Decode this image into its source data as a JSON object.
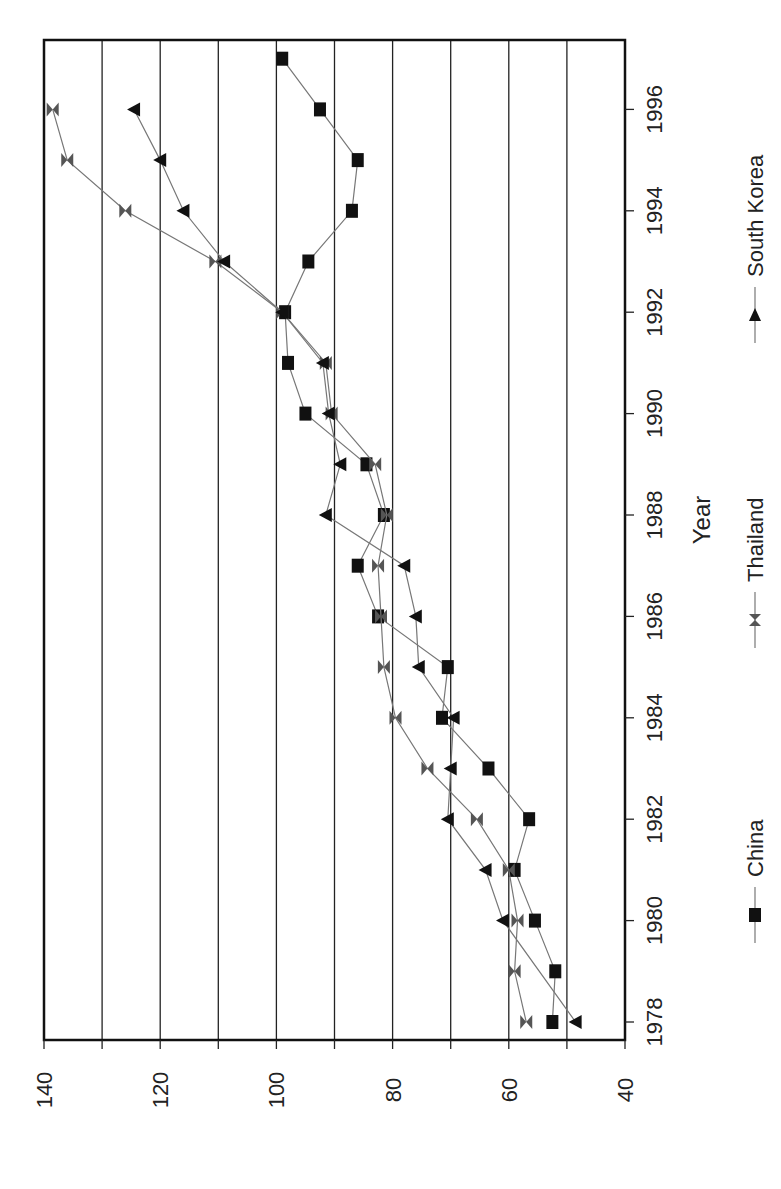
{
  "chart_data": {
    "type": "line",
    "orientation_note": "figure rendered rotated 90 degrees (text reads bottom-to-top)",
    "title": "",
    "xlabel": "Year",
    "ylabel": "",
    "x": [
      1978,
      1979,
      1980,
      1981,
      1982,
      1983,
      1984,
      1985,
      1986,
      1987,
      1988,
      1989,
      1990,
      1991,
      1992,
      1993,
      1994,
      1995,
      1996,
      1997
    ],
    "x_ticks": [
      1978,
      1980,
      1982,
      1984,
      1986,
      1988,
      1990,
      1992,
      1994,
      1996
    ],
    "y_ticks": [
      40,
      60,
      80,
      100,
      120,
      140
    ],
    "ylim": [
      40,
      140
    ],
    "grid": {
      "y_major_every": 10,
      "on": true
    },
    "legend_position": "bottom",
    "series": [
      {
        "name": "China",
        "marker": "square",
        "color": "#111111",
        "values": [
          52.5,
          52,
          55.5,
          59,
          56.5,
          63.5,
          71.5,
          70.5,
          82.5,
          86,
          81.5,
          84.5,
          95,
          98,
          98.5,
          94.5,
          87,
          86,
          92.5,
          99
        ]
      },
      {
        "name": "Thailand",
        "marker": "bowtie",
        "color": "#555555",
        "values": [
          57,
          59,
          58.5,
          60,
          65.5,
          74,
          79.5,
          81.5,
          82,
          82.5,
          81,
          83,
          90.5,
          91.5,
          99,
          110.5,
          126,
          136,
          138.5,
          null
        ]
      },
      {
        "name": "South Korea",
        "marker": "triangle",
        "color": "#111111",
        "values": [
          48.5,
          null,
          61,
          64,
          70.5,
          70,
          69.5,
          75.5,
          76,
          78,
          91.5,
          89,
          91,
          92,
          99,
          109,
          116,
          120,
          124.5,
          null
        ]
      }
    ]
  }
}
